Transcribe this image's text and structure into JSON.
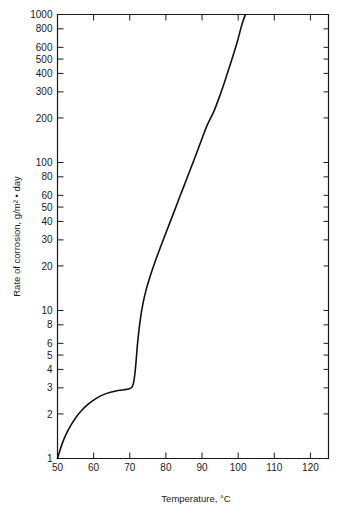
{
  "chart_data": {
    "type": "line",
    "title": "",
    "xlabel": "Temperature, °C",
    "ylabel": "Rate of corrosion, g/m² • day",
    "xscale": "linear",
    "yscale": "log",
    "xlim": [
      50,
      125
    ],
    "ylim": [
      1,
      1000
    ],
    "grid": false,
    "legend": null,
    "xticks": [
      50,
      60,
      70,
      80,
      90,
      100,
      110,
      120
    ],
    "xtick_labels": [
      "50",
      "60",
      "70",
      "80",
      "90",
      "100",
      "110",
      "120"
    ],
    "yticks": [
      1,
      2,
      3,
      4,
      5,
      6,
      8,
      10,
      20,
      30,
      40,
      50,
      60,
      80,
      100,
      200,
      300,
      400,
      500,
      600,
      800,
      1000
    ],
    "ytick_labels": [
      "1",
      "2",
      "3",
      "4",
      "5",
      "6",
      "8",
      "10",
      "20",
      "30",
      "40",
      "50",
      "60",
      "80",
      "100",
      "200",
      "300",
      "400",
      "500",
      "600",
      "800",
      "1000"
    ],
    "series": [
      {
        "name": "Rate of corrosion",
        "color": "#111111",
        "x": [
          50.0,
          50.6,
          51.4,
          52.4,
          53.6,
          55.0,
          56.6,
          58.4,
          60.4,
          62.4,
          64.4,
          66.2,
          67.8,
          69.0,
          69.9,
          70.5,
          70.9,
          71.2,
          71.5,
          71.8,
          72.1,
          72.5,
          73.0,
          73.7,
          74.6,
          75.8,
          77.2,
          78.8,
          80.5,
          82.2,
          84.0,
          85.8,
          87.5,
          89.0,
          90.3,
          91.4,
          92.4,
          93.4,
          94.5,
          95.7,
          97.0,
          98.4,
          99.8,
          101.0,
          102.0
        ],
        "y": [
          1.0,
          1.12,
          1.28,
          1.46,
          1.66,
          1.88,
          2.1,
          2.32,
          2.52,
          2.68,
          2.79,
          2.86,
          2.9,
          2.93,
          2.96,
          3.02,
          3.15,
          3.4,
          3.9,
          4.7,
          5.8,
          7.2,
          9.0,
          11.3,
          14.0,
          17.5,
          22.0,
          28.0,
          36.0,
          46.0,
          60.0,
          78.0,
          100.0,
          125.0,
          152.0,
          178.0,
          200.0,
          225.0,
          265.0,
          320.0,
          400.0,
          510.0,
          660.0,
          850.0,
          1000.0
        ]
      }
    ]
  }
}
